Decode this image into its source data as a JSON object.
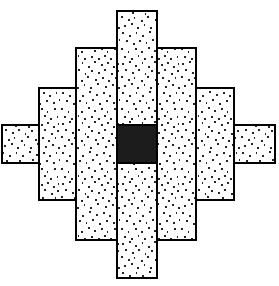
{
  "figure": {
    "title": "Nested stippled rectangles with black center square",
    "canvas": {
      "width": 279,
      "height": 286,
      "background": "#ffffff"
    },
    "style": {
      "fill_pattern": "stipple",
      "fill_base_color": "#ffffff",
      "stipple_dot_color": "#1a1a1a",
      "stipple_density": "dense",
      "stroke_color": "#000000",
      "stroke_width": 1.4,
      "solid_fill_color": "#1c1c1c"
    },
    "shapes": [
      {
        "id": "outer-horizontal-bar",
        "name": "Outermost horizontal bar",
        "kind": "rect",
        "fill": "stipple",
        "x": 2,
        "y": 125,
        "width": 273,
        "height": 38,
        "z": 1
      },
      {
        "id": "level3-vertical-bar",
        "name": "Third level vertical bar",
        "kind": "rect",
        "fill": "stipple",
        "x": 39,
        "y": 88,
        "width": 195,
        "height": 112,
        "z": 2
      },
      {
        "id": "level2-vertical-bar",
        "name": "Second level vertical bar",
        "kind": "rect",
        "fill": "stipple",
        "x": 76,
        "y": 48,
        "width": 120,
        "height": 192,
        "z": 3
      },
      {
        "id": "center-vertical-bar",
        "name": "Central tall vertical bar",
        "kind": "rect",
        "fill": "stipple",
        "x": 117,
        "y": 11,
        "width": 40,
        "height": 267,
        "z": 4
      },
      {
        "id": "center-black-square",
        "name": "Central black square",
        "kind": "rect",
        "fill": "solid",
        "x": 117,
        "y": 125,
        "width": 40,
        "height": 38,
        "z": 5
      }
    ],
    "dividers": [
      {
        "id": "divider-left-outer",
        "name": "Left outer vertical divider",
        "x": 39,
        "y1": 125,
        "y2": 163
      },
      {
        "id": "divider-right-outer",
        "name": "Right outer vertical divider",
        "x": 234,
        "y1": 125,
        "y2": 163
      },
      {
        "id": "divider-left-level3",
        "name": "Left level3 vertical divider",
        "x": 76,
        "y1": 88,
        "y2": 200
      },
      {
        "id": "divider-right-level3",
        "name": "Right level3 vertical divider",
        "x": 196,
        "y1": 88,
        "y2": 200
      },
      {
        "id": "divider-left-level2",
        "name": "Left level2 vertical divider",
        "x": 117,
        "y1": 48,
        "y2": 240
      },
      {
        "id": "divider-right-level2",
        "name": "Right level2 vertical divider",
        "x": 157,
        "y1": 48,
        "y2": 240
      }
    ]
  }
}
